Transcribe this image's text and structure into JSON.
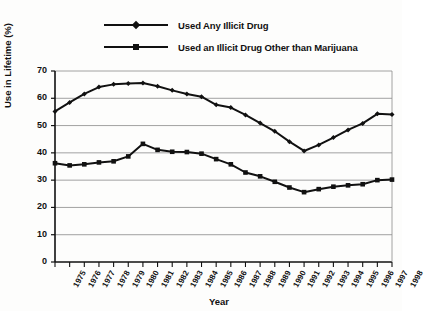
{
  "legend": {
    "items": [
      {
        "label": "Used Any Illicit Drug",
        "marker": "diamond-marker",
        "color": "#111111"
      },
      {
        "label": "Used an Illicit Drug Other than Marijuana",
        "marker": "square-marker",
        "color": "#111111"
      }
    ]
  },
  "axes": {
    "ylabel": "Use in Lifetime (%)",
    "xlabel": "Year",
    "yticks": [
      0,
      10,
      20,
      30,
      40,
      50,
      60,
      70
    ],
    "xticks": [
      "1975",
      "1976",
      "1977",
      "1978",
      "1979",
      "1980",
      "1981",
      "1982",
      "1983",
      "1984",
      "1985",
      "1986",
      "1987",
      "1988",
      "1989",
      "1990",
      "1991",
      "1992",
      "1993",
      "1994",
      "1995",
      "1996",
      "1997",
      "1998"
    ]
  },
  "chart_data": {
    "type": "line",
    "title": "",
    "xlabel": "Year",
    "ylabel": "Use in Lifetime (%)",
    "ylim": [
      0,
      70
    ],
    "yticks": [
      0,
      10,
      20,
      30,
      40,
      50,
      60,
      70
    ],
    "grid": true,
    "legend_position": "top",
    "x": [
      "1975",
      "1976",
      "1977",
      "1978",
      "1979",
      "1980",
      "1981",
      "1982",
      "1983",
      "1984",
      "1985",
      "1986",
      "1987",
      "1988",
      "1989",
      "1990",
      "1991",
      "1992",
      "1993",
      "1994",
      "1995",
      "1996",
      "1997",
      "1998"
    ],
    "series": [
      {
        "name": "Used Any Illicit Drug",
        "marker": "diamond",
        "color": "#111111",
        "values": [
          55.2,
          58.5,
          61.6,
          64.1,
          65.1,
          65.4,
          65.6,
          64.4,
          62.9,
          61.6,
          60.6,
          57.6,
          56.6,
          53.9,
          50.9,
          47.9,
          44.1,
          40.7,
          42.9,
          45.6,
          48.4,
          50.8,
          54.3,
          54.1
        ]
      },
      {
        "name": "Used an Illicit Drug Other than Marijuana",
        "marker": "square",
        "color": "#111111",
        "values": [
          36.2,
          35.4,
          35.8,
          36.5,
          36.9,
          38.7,
          43.3,
          41.1,
          40.4,
          40.3,
          39.7,
          37.7,
          35.8,
          32.8,
          31.4,
          29.4,
          27.3,
          25.6,
          26.7,
          27.6,
          28.1,
          28.5,
          30.0,
          30.2
        ]
      }
    ]
  }
}
